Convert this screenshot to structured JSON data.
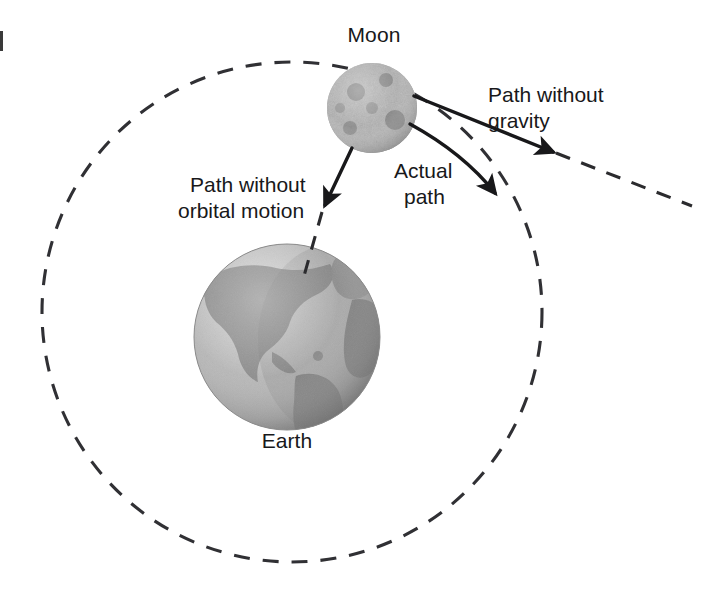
{
  "figure": {
    "kind": "physics-diagram",
    "background_color": "#ffffff",
    "ink_color": "#18181a"
  },
  "bodies": {
    "moon": {
      "label": "Moon",
      "label_x": 374,
      "label_y": 42,
      "center_x": 372,
      "center_y": 108,
      "radius": 45,
      "surface_tone": "#b9b9b9",
      "crater_tone": "#555555"
    },
    "earth": {
      "label": "Earth",
      "label_x": 287,
      "label_y": 448,
      "center_x": 287,
      "center_y": 337,
      "radius": 93,
      "ocean_tone": "#b5b5b5",
      "land_tone": "#8d8d8d"
    }
  },
  "orbit": {
    "name": "orbital-path",
    "center_x": 292,
    "center_y": 312,
    "radius": 250,
    "style": "dashed",
    "dash_pattern": "16 13",
    "stroke_width": 3.1
  },
  "annotations": [
    {
      "id": "path-without-gravity",
      "text_line1": "Path without",
      "text_line2": "gravity",
      "text_x": 488,
      "text_y": 102,
      "arrow_color": "#18181a",
      "continues_dashed": true
    },
    {
      "id": "actual-path",
      "text_line1": "Actual",
      "text_line2": "path",
      "text_x": 394,
      "text_y": 178,
      "arrow_color": "#18181a",
      "continues_dashed": true
    },
    {
      "id": "path-without-orbital-motion",
      "text_line1": "Path without",
      "text_line2": "orbital motion",
      "text_x": 190,
      "text_y": 192,
      "arrow_color": "#18181a",
      "continues_dashed": true
    }
  ],
  "edge_mark": {
    "present": true,
    "x": 0,
    "y": 31,
    "width": 3,
    "height": 20,
    "color": "#3a3a3a"
  }
}
